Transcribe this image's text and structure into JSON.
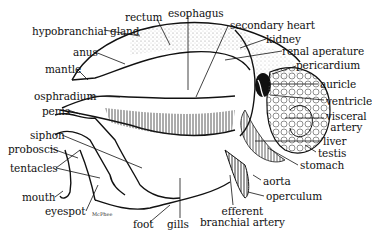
{
  "figure": {
    "signature": "McPhee"
  },
  "labels": [
    {
      "id": "rectum",
      "text": "rectum",
      "x": 125,
      "y": 12
    },
    {
      "id": "esophagus",
      "text": "esophagus",
      "x": 168,
      "y": 8
    },
    {
      "id": "hypobranchial-gland",
      "text": "hypobranchial gland",
      "x": 32,
      "y": 26
    },
    {
      "id": "secondary-heart",
      "text": "secondary heart",
      "x": 230,
      "y": 20
    },
    {
      "id": "kidney",
      "text": "kidney",
      "x": 266,
      "y": 34
    },
    {
      "id": "anus",
      "text": "anus",
      "x": 73,
      "y": 47
    },
    {
      "id": "renal-aperature",
      "text": "renal aperature",
      "x": 282,
      "y": 46
    },
    {
      "id": "mantle",
      "text": "mantle",
      "x": 45,
      "y": 64
    },
    {
      "id": "pericardium",
      "text": "pericardium",
      "x": 296,
      "y": 60
    },
    {
      "id": "auricle",
      "text": "auricle",
      "x": 320,
      "y": 79
    },
    {
      "id": "osphradium",
      "text": "osphradium",
      "x": 34,
      "y": 91
    },
    {
      "id": "penis",
      "text": "penis",
      "x": 42,
      "y": 106
    },
    {
      "id": "ventricle",
      "text": "ventricle",
      "x": 326,
      "y": 96
    },
    {
      "id": "visceral-artery",
      "text": "visceral\nartery",
      "x": 326,
      "y": 111
    },
    {
      "id": "siphon",
      "text": "siphon",
      "x": 30,
      "y": 130
    },
    {
      "id": "liver",
      "text": "liver",
      "x": 323,
      "y": 136
    },
    {
      "id": "proboscis",
      "text": "proboscis",
      "x": 8,
      "y": 144
    },
    {
      "id": "testis",
      "text": "testis",
      "x": 318,
      "y": 148
    },
    {
      "id": "tentacles",
      "text": "tentacles",
      "x": 10,
      "y": 163
    },
    {
      "id": "stomach",
      "text": "stomach",
      "x": 300,
      "y": 160
    },
    {
      "id": "aorta",
      "text": "aorta",
      "x": 263,
      "y": 176
    },
    {
      "id": "mouth",
      "text": "mouth",
      "x": 22,
      "y": 192
    },
    {
      "id": "operculum",
      "text": "operculum",
      "x": 266,
      "y": 191
    },
    {
      "id": "eyespot",
      "text": "eyespot",
      "x": 45,
      "y": 206
    },
    {
      "id": "efferent-branchial-artery",
      "text": "efferent\nbranchial artery",
      "x": 200,
      "y": 206
    },
    {
      "id": "foot",
      "text": "foot",
      "x": 133,
      "y": 219
    },
    {
      "id": "gills",
      "text": "gills",
      "x": 167,
      "y": 219
    }
  ]
}
